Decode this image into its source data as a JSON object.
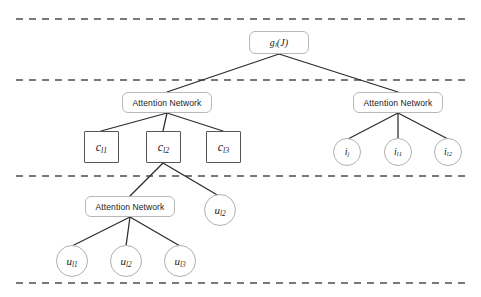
{
  "figure": {
    "type": "hierarchical-attention-network-diagram",
    "background": "#ffffff",
    "width": 481,
    "height": 297,
    "edge_color": "#2b2b2b",
    "separator_color": "#4d4d4d",
    "rounded_node_border": "#b8b8b8",
    "square_node_border": "#555555",
    "circle_node_border": "#b0b0b0"
  },
  "separators": [
    {
      "name": "separator-top",
      "y": 19,
      "x1": 16,
      "x2": 470
    },
    {
      "name": "separator-second",
      "y": 80,
      "x1": 16,
      "x2": 470
    },
    {
      "name": "separator-third",
      "y": 176,
      "x1": 16,
      "x2": 470
    },
    {
      "name": "separator-bottom",
      "y": 283,
      "x1": 16,
      "x2": 470
    }
  ],
  "nodes": {
    "root": {
      "label_main": "g",
      "label_sub": "l",
      "label_tail": "(J)",
      "shape": "rounded-rect"
    },
    "attention_left": {
      "label": "Attention Network",
      "shape": "rounded-rect"
    },
    "attention_right": {
      "label": "Attention Network",
      "shape": "rounded-rect"
    },
    "attention_bottom": {
      "label": "Attention Network",
      "shape": "rounded-rect"
    },
    "c_nodes": [
      {
        "name": "c-l1",
        "label_main": "c",
        "label_sub": "l1",
        "shape": "square"
      },
      {
        "name": "c-l2",
        "label_main": "c",
        "label_sub": "l2",
        "shape": "square"
      },
      {
        "name": "c-l3",
        "label_main": "c",
        "label_sub": "l3",
        "shape": "square"
      }
    ],
    "i_nodes": [
      {
        "name": "i-j",
        "label_main": "i",
        "label_sub": "j",
        "shape": "circle"
      },
      {
        "name": "i-l1",
        "label_main": "i",
        "label_sub": "l1",
        "shape": "circle"
      },
      {
        "name": "i-l2",
        "label_main": "i",
        "label_sub": "l2",
        "shape": "circle"
      }
    ],
    "u_nodes": [
      {
        "name": "u-l1",
        "label_main": "u",
        "label_sub": "l1",
        "shape": "circle"
      },
      {
        "name": "u-l2-bottom",
        "label_main": "u",
        "label_sub": "l2",
        "shape": "circle"
      },
      {
        "name": "u-l3",
        "label_main": "u",
        "label_sub": "l3",
        "shape": "circle"
      }
    ],
    "u_side": {
      "name": "u-l2-side",
      "label_main": "u",
      "label_sub": "l2",
      "shape": "circle"
    }
  }
}
